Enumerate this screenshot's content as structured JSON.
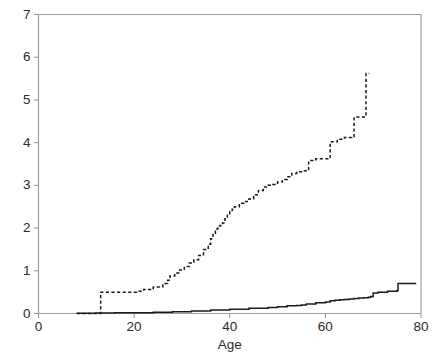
{
  "chart_data": {
    "type": "line",
    "title": "",
    "subtitle": "",
    "xlabel": "Age",
    "ylabel": "",
    "xlim": [
      0,
      80
    ],
    "ylim": [
      0,
      7
    ],
    "xticks": [
      0,
      20,
      40,
      60,
      80
    ],
    "xtick_labels": [
      "0",
      "20",
      "40",
      "60",
      "80"
    ],
    "yticks": [
      0,
      1,
      2,
      3,
      4,
      5,
      6,
      7
    ],
    "ytick_labels": [
      "0",
      "1",
      "2",
      "3",
      "4",
      "5",
      "6",
      "7"
    ],
    "grid": false,
    "legend": null,
    "step_interpolation": "post",
    "series": [
      {
        "name": "dashed-curve",
        "style": "dashed",
        "color": "#1a1a1a",
        "x": [
          8.0,
          13.0,
          13.0,
          19.5,
          20.5,
          22.0,
          24.0,
          26.0,
          27.0,
          27.5,
          28.5,
          29.5,
          30.5,
          31.5,
          32.5,
          33.5,
          34.5,
          35.5,
          36.0,
          36.5,
          37.0,
          37.5,
          38.0,
          38.5,
          39.0,
          39.5,
          40.0,
          40.5,
          41.0,
          42.0,
          43.0,
          44.0,
          45.0,
          46.0,
          47.0,
          48.0,
          49.0,
          50.0,
          51.0,
          52.0,
          53.0,
          54.0,
          55.0,
          56.0,
          56.5,
          58.0,
          60.0,
          61.0,
          62.5,
          64.0,
          65.5,
          66.0,
          67.5,
          68.5,
          68.5,
          69.2
        ],
        "y": [
          0.0,
          0.0,
          0.5,
          0.5,
          0.52,
          0.56,
          0.62,
          0.7,
          0.78,
          0.88,
          0.95,
          1.02,
          1.1,
          1.18,
          1.26,
          1.36,
          1.5,
          1.62,
          1.75,
          1.88,
          1.98,
          2.05,
          2.06,
          2.12,
          2.22,
          2.3,
          2.38,
          2.44,
          2.5,
          2.58,
          2.62,
          2.68,
          2.78,
          2.88,
          2.96,
          3.0,
          3.02,
          3.08,
          3.14,
          3.2,
          3.28,
          3.32,
          3.34,
          3.34,
          3.58,
          3.62,
          3.62,
          4.02,
          4.08,
          4.12,
          4.14,
          4.6,
          4.6,
          4.6,
          5.62,
          5.62
        ]
      },
      {
        "name": "solid-curve",
        "style": "solid",
        "color": "#1a1a1a",
        "x": [
          8.0,
          12.0,
          16.0,
          20.0,
          24.0,
          28.0,
          32.0,
          36.0,
          40.0,
          44.0,
          48.0,
          50.0,
          52.0,
          54.0,
          55.0,
          56.0,
          58.0,
          60.0,
          61.0,
          62.0,
          63.0,
          64.0,
          65.0,
          66.0,
          67.0,
          68.0,
          69.0,
          69.5,
          70.0,
          71.0,
          73.0,
          75.0,
          75.2,
          79.0
        ],
        "y": [
          0.005,
          0.01,
          0.015,
          0.02,
          0.03,
          0.04,
          0.06,
          0.08,
          0.1,
          0.12,
          0.14,
          0.16,
          0.18,
          0.19,
          0.2,
          0.22,
          0.25,
          0.27,
          0.3,
          0.31,
          0.32,
          0.33,
          0.34,
          0.35,
          0.36,
          0.37,
          0.38,
          0.4,
          0.48,
          0.5,
          0.52,
          0.54,
          0.7,
          0.7
        ]
      }
    ]
  },
  "axes": {
    "x_title": "Age"
  }
}
